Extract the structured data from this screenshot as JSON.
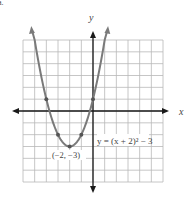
{
  "corner_label": "a.",
  "chart_data": {
    "type": "line",
    "title": "",
    "xlabel": "x",
    "ylabel": "y",
    "xlim": [
      -6,
      6
    ],
    "ylim": [
      -6,
      6
    ],
    "grid": true,
    "grid_step": 1,
    "equation_label": "y = (x + 2)² − 3",
    "vertex_label": "(−2, −3)",
    "function": {
      "a": 1,
      "h": -2,
      "k": -3
    },
    "series": [
      {
        "name": "y = (x + 2)^2 - 3",
        "curve_x_range": [
          -5,
          1
        ],
        "points": [
          {
            "x": -5,
            "y": 6
          },
          {
            "x": -4,
            "y": 1
          },
          {
            "x": -3,
            "y": -2
          },
          {
            "x": -2,
            "y": -3
          },
          {
            "x": -1,
            "y": -2
          },
          {
            "x": 0,
            "y": 1
          },
          {
            "x": 1,
            "y": 6
          }
        ],
        "marked_points": [
          {
            "x": -4,
            "y": 1
          },
          {
            "x": -3,
            "y": -2
          },
          {
            "x": -2,
            "y": -3
          },
          {
            "x": -1,
            "y": -2
          },
          {
            "x": 0,
            "y": 1
          }
        ]
      }
    ],
    "colors": {
      "grid": "#b8b8b8",
      "axes": "#1a1a1a",
      "curve": "#7a7a7a",
      "points": "#555555"
    }
  }
}
